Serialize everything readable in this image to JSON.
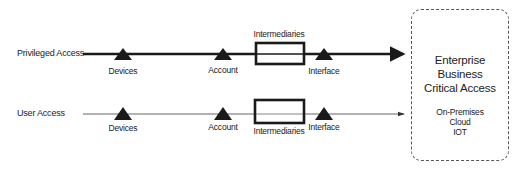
{
  "rows": [
    {
      "label": "Privileged Access",
      "nodes": {
        "devices": "Devices",
        "account": "Account",
        "intermediaries": "Intermediaries",
        "interface": "Interface"
      },
      "line_weight": "thick"
    },
    {
      "label": "User Access",
      "nodes": {
        "devices": "Devices",
        "account": "Account",
        "intermediaries": "Intermediaries",
        "interface": "Interface"
      },
      "line_weight": "thin"
    }
  ],
  "target": {
    "title_lines": [
      "Enterprise",
      "Business",
      "Critical Access"
    ],
    "sub_lines": [
      "On-Premises",
      "Cloud",
      "IOT"
    ]
  },
  "colors": {
    "stroke": "#1a1a1a",
    "thin_stroke": "#555555",
    "dashed_border": "#555555",
    "background": "#ffffff"
  }
}
